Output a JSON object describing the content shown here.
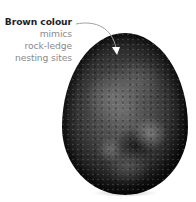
{
  "annotation": {
    "title": "Brown colour",
    "lines": [
      "mimics",
      "rock-ledge",
      "nesting sites"
    ]
  },
  "image": {
    "subject": "egg",
    "description": "Dark mottled egg photographed on white background"
  },
  "icons": {
    "pointer": "curved-arrow-icon"
  },
  "colors": {
    "background": "#ffffff",
    "title_text": "#1f1f1f",
    "body_text": "#8a8a8a",
    "arrow": "#9a9a9a"
  }
}
